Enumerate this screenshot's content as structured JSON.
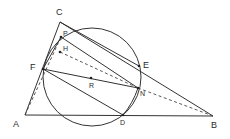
{
  "diagram": {
    "type": "geometry",
    "stroke_color": "#333333",
    "background": "#ffffff",
    "points": {
      "A": {
        "label": "A",
        "x": 25,
        "y": 115
      },
      "B": {
        "label": "B",
        "x": 213,
        "y": 116
      },
      "C": {
        "label": "C",
        "x": 60,
        "y": 22
      },
      "D": {
        "label": "D",
        "x": 123,
        "y": 115
      },
      "E": {
        "label": "E",
        "x": 139,
        "y": 66
      },
      "F": {
        "label": "F",
        "x": 43,
        "y": 69
      },
      "H": {
        "label": "H",
        "x": 60,
        "y": 50
      },
      "N": {
        "label": "N",
        "x": 138,
        "y": 88
      },
      "P": {
        "label": "P",
        "x": 61,
        "y": 37
      },
      "R": {
        "label": "R",
        "x": 91,
        "y": 78
      }
    },
    "circle": {
      "center": "R",
      "cx": 92,
      "cy": 77,
      "r": 49
    },
    "solid_segments": [
      [
        "A",
        "B"
      ],
      [
        "A",
        "C"
      ],
      [
        "C",
        "B"
      ],
      [
        "C",
        "E"
      ],
      [
        "P",
        "N"
      ],
      [
        "F",
        "N"
      ],
      [
        "F",
        "D"
      ],
      [
        "F",
        "P"
      ],
      [
        "N",
        "D"
      ]
    ],
    "dashed_segments": [
      [
        "A",
        "P"
      ],
      [
        "H",
        "N"
      ],
      [
        "N",
        "B"
      ],
      [
        "F",
        "H"
      ]
    ]
  }
}
